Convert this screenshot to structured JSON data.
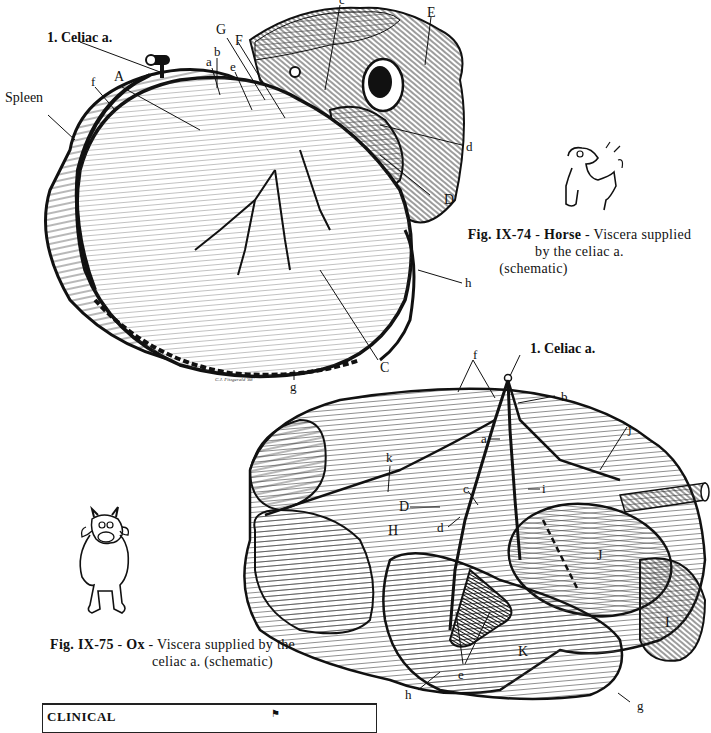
{
  "page": {
    "figures": [
      {
        "id": "fig-ix-74",
        "caption_number": "Fig. IX-74",
        "caption_species": "Horse",
        "caption_text_line1": "- Viscera supplied",
        "caption_text_line2": "by the celiac a.",
        "caption_text_line3": "(schematic)",
        "artery_label": "1. Celiac a.",
        "labels": {
          "spleen": "Spleen",
          "f": "f",
          "A": "A",
          "a": "a",
          "b": "b",
          "e": "e",
          "G": "G",
          "F": "F",
          "c": "c",
          "E": "E",
          "d": "d",
          "D": "D",
          "h": "h",
          "C": "C",
          "g": "g"
        },
        "artist_signature": "C.J. Fitzgerald '88"
      },
      {
        "id": "fig-ix-75",
        "caption_number": "Fig. IX-75",
        "caption_species": "Ox",
        "caption_text_line1": "- Viscera supplied by the",
        "caption_text_line2": "celiac a. (schematic)",
        "artery_label": "1. Celiac a.",
        "labels": {
          "f": "f",
          "b": "b",
          "a": "a",
          "j_upper": "j",
          "k": "k",
          "c": "c",
          "i": "i",
          "D": "D",
          "d": "d",
          "H": "H",
          "J": "J",
          "I": "I",
          "K": "K",
          "e": "e",
          "h": "h",
          "g": "g"
        }
      }
    ],
    "clinical_box": {
      "title": "CLINICAL"
    }
  }
}
